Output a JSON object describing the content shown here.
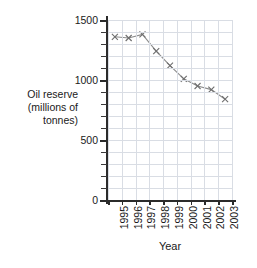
{
  "chart_data": {
    "type": "line",
    "title": "",
    "xlabel": "Year",
    "ylabel": "Oil reserve (millions of tonnes)",
    "categories": [
      "1995",
      "1996",
      "1997",
      "1998",
      "1999",
      "2000",
      "2001",
      "2002",
      "2003"
    ],
    "values": [
      1360,
      1350,
      1380,
      1240,
      1120,
      1010,
      950,
      920,
      840
    ],
    "series": [
      {
        "name": "Oil reserve",
        "values": [
          1360,
          1350,
          1380,
          1240,
          1120,
          1010,
          950,
          920,
          840
        ]
      }
    ],
    "ylim": [
      0,
      1500
    ],
    "y_ticks": [
      0,
      500,
      1000,
      1500
    ],
    "y_tick_labels": [
      "0",
      "500",
      "1000",
      "1500"
    ],
    "y_minor_tick_step": 100,
    "x_tick_labels_rotation": "vertical",
    "grid": true,
    "legend": "none",
    "marker": "x",
    "line_color": "#8c8c8c",
    "marker_color": "#6e6e6e",
    "grid_color": "#d9dde4",
    "axis_color": "#2b2b2b"
  },
  "axis": {
    "y_title_lines": [
      "Oil reserve",
      "(millions of",
      "tonnes)"
    ],
    "x_title": "Year"
  },
  "caption": {
    "text": ""
  }
}
